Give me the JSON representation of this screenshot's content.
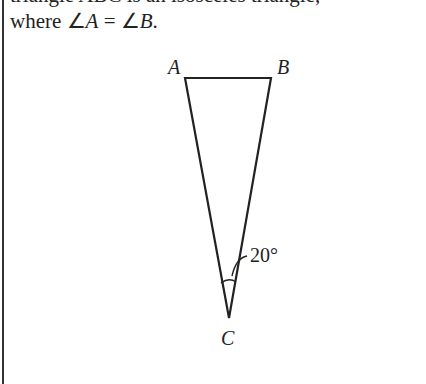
{
  "text": {
    "cut_line": "triangle ABC is an isosceles triangle,",
    "prefix": "where ",
    "angle_symbol": "∠",
    "vertex_a": "A",
    "equals": " = ",
    "vertex_b": "B",
    "suffix": "."
  },
  "figure": {
    "labels": {
      "a": "A",
      "b": "B",
      "c": "C"
    },
    "angle_at_c": "20°",
    "stroke_color": "#222222"
  }
}
